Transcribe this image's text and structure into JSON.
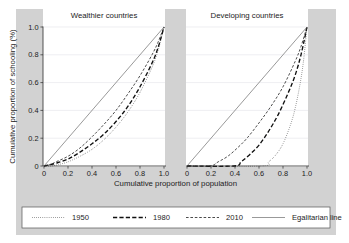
{
  "figure": {
    "background_color": "#d2d2d2",
    "plot_background_color": "#ffffff",
    "gridline_color": "#e3e3e8",
    "axis_color": "#2b2b2b"
  },
  "chart_data": {
    "type": "line",
    "title": "",
    "xlabel": "Cumulative proportion of population",
    "ylabel": "Cumulative proportion of schooling (%)",
    "xlim": [
      0,
      1
    ],
    "ylim": [
      0,
      1
    ],
    "xticks": [
      "0",
      "0.2",
      "0.4",
      "0.6",
      "0.8",
      "1.0"
    ],
    "xtick_values": [
      0,
      0.2,
      0.4,
      0.6,
      0.8,
      1.0
    ],
    "yticks": [
      "0",
      "0.2",
      "0.4",
      "0.6",
      "0.8",
      "1.0"
    ],
    "ytick_values": [
      0,
      0.2,
      0.4,
      0.6,
      0.8,
      1.0
    ],
    "grid": "horizontal",
    "legend_position": "bottom",
    "panels": [
      {
        "name": "wealthier",
        "title": "Wealthier countries",
        "series": [
          {
            "name": "1950",
            "style": "dotted",
            "x": [
              0.0,
              0.06,
              0.12,
              0.2,
              0.3,
              0.4,
              0.5,
              0.6,
              0.7,
              0.8,
              0.9,
              0.95,
              1.0
            ],
            "y": [
              0.0,
              0.0,
              0.01,
              0.03,
              0.07,
              0.12,
              0.19,
              0.28,
              0.39,
              0.53,
              0.71,
              0.83,
              1.0
            ]
          },
          {
            "name": "1980",
            "style": "dashed-bold",
            "x": [
              0.0,
              0.05,
              0.1,
              0.2,
              0.3,
              0.4,
              0.5,
              0.6,
              0.7,
              0.8,
              0.9,
              0.95,
              1.0
            ],
            "y": [
              0.0,
              0.01,
              0.02,
              0.05,
              0.1,
              0.16,
              0.23,
              0.32,
              0.43,
              0.57,
              0.74,
              0.85,
              1.0
            ]
          },
          {
            "name": "2010",
            "style": "dashed",
            "x": [
              0.0,
              0.05,
              0.1,
              0.2,
              0.3,
              0.4,
              0.5,
              0.6,
              0.7,
              0.8,
              0.9,
              0.95,
              1.0
            ],
            "y": [
              0.0,
              0.01,
              0.03,
              0.07,
              0.13,
              0.21,
              0.3,
              0.4,
              0.52,
              0.65,
              0.8,
              0.89,
              1.0
            ]
          },
          {
            "name": "Egalitarian line",
            "style": "solid",
            "x": [
              0.0,
              1.0
            ],
            "y": [
              0.0,
              1.0
            ]
          }
        ]
      },
      {
        "name": "developing",
        "title": "Developing countries",
        "series": [
          {
            "name": "1950",
            "style": "dotted",
            "x": [
              0.0,
              0.62,
              0.68,
              0.74,
              0.8,
              0.86,
              0.9,
              0.94,
              0.97,
              1.0
            ],
            "y": [
              0.0,
              0.0,
              0.03,
              0.08,
              0.16,
              0.29,
              0.41,
              0.58,
              0.75,
              1.0
            ]
          },
          {
            "name": "1980",
            "style": "dashed-bold",
            "x": [
              0.0,
              0.39,
              0.45,
              0.52,
              0.6,
              0.68,
              0.76,
              0.84,
              0.9,
              0.95,
              1.0
            ],
            "y": [
              0.0,
              0.0,
              0.03,
              0.08,
              0.15,
              0.25,
              0.37,
              0.52,
              0.65,
              0.8,
              1.0
            ]
          },
          {
            "name": "2010",
            "style": "dashed",
            "x": [
              0.0,
              0.19,
              0.26,
              0.34,
              0.42,
              0.5,
              0.6,
              0.7,
              0.8,
              0.9,
              0.95,
              1.0
            ],
            "y": [
              0.0,
              0.0,
              0.03,
              0.07,
              0.13,
              0.2,
              0.31,
              0.43,
              0.57,
              0.75,
              0.86,
              1.0
            ]
          },
          {
            "name": "Egalitarian line",
            "style": "solid",
            "x": [
              0.0,
              1.0
            ],
            "y": [
              0.0,
              1.0
            ]
          }
        ]
      }
    ],
    "legend": [
      {
        "label": "1950",
        "style": "dotted"
      },
      {
        "label": "1980",
        "style": "dashed-bold"
      },
      {
        "label": "2010",
        "style": "dashed"
      },
      {
        "label": "Egalitarian line",
        "style": "solid"
      }
    ]
  }
}
